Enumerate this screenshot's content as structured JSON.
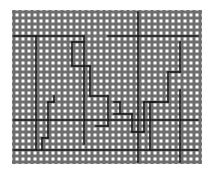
{
  "grid": {
    "x0": 14,
    "y0": 12,
    "cols": 31,
    "rows": 25,
    "pitch": 6,
    "line_width": 3,
    "line_color": "#6e6e6e",
    "background": "#ffffff"
  },
  "paths": {
    "color": "#1a1a1a",
    "width": 1.6,
    "segments": [
      [
        [
          36,
          36
        ],
        [
          36,
          150
        ]
      ],
      [
        [
          36,
          36
        ],
        [
          84,
          36
        ]
      ],
      [
        [
          84,
          36
        ],
        [
          84,
          144
        ]
      ],
      [
        [
          72,
          42
        ],
        [
          84,
          42
        ]
      ],
      [
        [
          72,
          42
        ],
        [
          72,
          66
        ]
      ],
      [
        [
          72,
          66
        ],
        [
          90,
          66
        ]
      ],
      [
        [
          90,
          66
        ],
        [
          90,
          96
        ]
      ],
      [
        [
          90,
          96
        ],
        [
          108,
          96
        ]
      ],
      [
        [
          108,
          96
        ],
        [
          108,
          126
        ]
      ],
      [
        [
          108,
          126
        ],
        [
          96,
          126
        ]
      ],
      [
        [
          0,
          36
        ],
        [
          36,
          36
        ]
      ],
      [
        [
          138,
          12
        ],
        [
          138,
          162
        ]
      ],
      [
        [
          108,
          36
        ],
        [
          198,
          36
        ]
      ],
      [
        [
          180,
          42
        ],
        [
          180,
          72
        ]
      ],
      [
        [
          168,
          72
        ],
        [
          180,
          72
        ]
      ],
      [
        [
          168,
          72
        ],
        [
          168,
          102
        ]
      ],
      [
        [
          150,
          102
        ],
        [
          168,
          102
        ]
      ],
      [
        [
          150,
          102
        ],
        [
          150,
          150
        ]
      ],
      [
        [
          48,
          102
        ],
        [
          54,
          102
        ]
      ],
      [
        [
          54,
          96
        ],
        [
          54,
          102
        ]
      ],
      [
        [
          48,
          102
        ],
        [
          48,
          138
        ]
      ],
      [
        [
          42,
          138
        ],
        [
          48,
          138
        ]
      ],
      [
        [
          42,
          138
        ],
        [
          42,
          150
        ]
      ],
      [
        [
          14,
          150
        ],
        [
          198,
          150
        ]
      ],
      [
        [
          114,
          102
        ],
        [
          120,
          102
        ]
      ],
      [
        [
          120,
          102
        ],
        [
          120,
          114
        ]
      ],
      [
        [
          114,
          114
        ],
        [
          132,
          114
        ]
      ],
      [
        [
          132,
          114
        ],
        [
          132,
          132
        ]
      ],
      [
        [
          132,
          132
        ],
        [
          144,
          132
        ]
      ],
      [
        [
          144,
          102
        ],
        [
          144,
          132
        ]
      ],
      [
        [
          144,
          102
        ],
        [
          156,
          102
        ]
      ],
      [
        [
          14,
          120
        ],
        [
          198,
          120
        ]
      ],
      [
        [
          180,
          90
        ],
        [
          180,
          162
        ]
      ]
    ]
  }
}
